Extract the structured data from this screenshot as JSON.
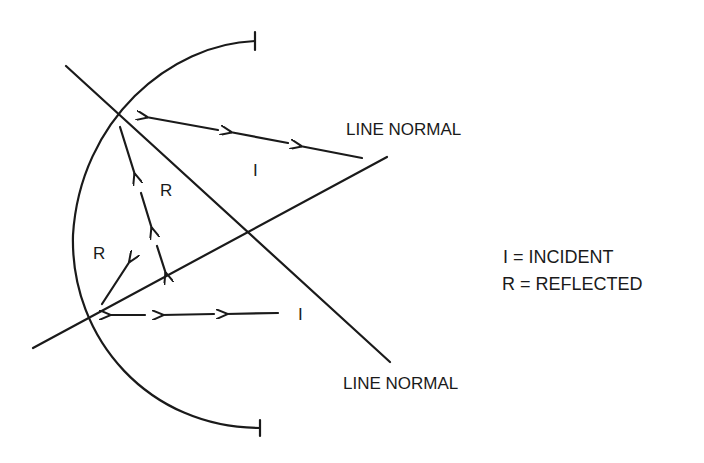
{
  "diagram": {
    "labels": {
      "line_normal_upper": "LINE NORMAL",
      "line_normal_lower": "LINE NORMAL",
      "incident_upper": "I",
      "incident_lower": "I",
      "reflected_upper": "R",
      "reflected_lower": "R"
    },
    "legend": {
      "incident": "I = INCIDENT",
      "reflected": "R = REFLECTED"
    },
    "colors": {
      "stroke": "#1a1a1a",
      "background": "#ffffff"
    }
  }
}
